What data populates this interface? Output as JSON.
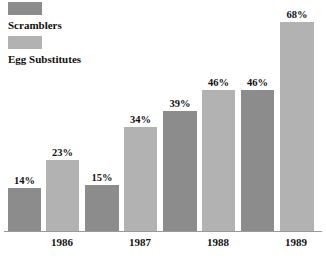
{
  "chart_data": {
    "type": "bar",
    "title": "",
    "subtitle": "",
    "xlabel": "",
    "ylabel": "",
    "categories": [
      "1986",
      "1987",
      "1988",
      "1989"
    ],
    "series": [
      {
        "name": "Scramblers",
        "color": "#8c8c8c",
        "values": [
          14,
          15,
          39,
          46
        ],
        "value_labels": [
          "14%",
          "15%",
          "39%",
          "46%"
        ]
      },
      {
        "name": "Egg Substitutes",
        "color": "#b2b2b2",
        "values": [
          23,
          34,
          46,
          68
        ],
        "value_labels": [
          "23%",
          "34%",
          "46%",
          "68%"
        ]
      }
    ],
    "ylim": [
      0,
      72
    ],
    "grid": false,
    "legend_position": "top-left",
    "value_label_suffix": "%"
  },
  "legend": {
    "entries": [
      {
        "label": "Scramblers",
        "color": "#8c8c8c"
      },
      {
        "label": "Egg Substitutes",
        "color": "#b2b2b2"
      }
    ]
  },
  "axis": {
    "years": [
      "1986",
      "1987",
      "1988",
      "1989"
    ]
  },
  "bars": [
    {
      "label": "14%",
      "color": "#8c8c8c",
      "left": 8,
      "width": 33,
      "height": 43,
      "series": "Scramblers",
      "year": "1986"
    },
    {
      "label": "23%",
      "color": "#b2b2b2",
      "left": 46,
      "width": 33,
      "height": 71,
      "series": "Egg Substitutes",
      "year": "1986"
    },
    {
      "label": "15%",
      "color": "#8c8c8c",
      "left": 85,
      "width": 34,
      "height": 46,
      "series": "Scramblers",
      "year": "1987"
    },
    {
      "label": "34%",
      "color": "#b2b2b2",
      "left": 124,
      "width": 33,
      "height": 104,
      "series": "Egg Substitutes",
      "year": "1987"
    },
    {
      "label": "39%",
      "color": "#8c8c8c",
      "left": 163,
      "width": 34,
      "height": 120,
      "series": "Scramblers",
      "year": "1988"
    },
    {
      "label": "46%",
      "color": "#b2b2b2",
      "left": 202,
      "width": 33,
      "height": 141,
      "series": "Egg Substitutes",
      "year": "1988"
    },
    {
      "label": "46%",
      "color": "#8c8c8c",
      "left": 241,
      "width": 33,
      "height": 141,
      "series": "Scramblers",
      "year": "1989"
    },
    {
      "label": "68%",
      "color": "#b2b2b2",
      "left": 280,
      "width": 34,
      "height": 209,
      "series": "Egg Substitutes",
      "year": "1989"
    }
  ],
  "year_ticks": [
    {
      "label": "1986",
      "center": 62
    },
    {
      "label": "1987",
      "center": 140
    },
    {
      "label": "1988",
      "center": 218
    },
    {
      "label": "1989",
      "center": 296
    }
  ]
}
